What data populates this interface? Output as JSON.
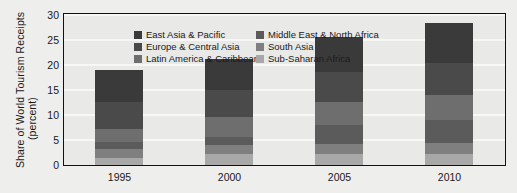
{
  "chart_data": {
    "type": "bar",
    "subtype": "stacked-column",
    "title": "",
    "xlabel": "",
    "ylabel": "Share of World Tourism Receipts (percent)",
    "ylabel_lines": [
      "Share of World Tourism Receipts",
      "(percent)"
    ],
    "categories": [
      "1995",
      "2000",
      "2005",
      "2010"
    ],
    "ylim": [
      0,
      30
    ],
    "yticks": [
      0,
      5,
      10,
      15,
      20,
      25,
      30
    ],
    "ytick_labels": [
      "0",
      "5",
      "10",
      "15",
      "20",
      "25",
      "30"
    ],
    "grid": true,
    "grid_axis": "y",
    "legend_position": "upper-left-inside",
    "legend_columns": 2,
    "series": [
      {
        "name": "East Asia & Pacific",
        "color": "#3a3a3a",
        "values": [
          6.3,
          6.2,
          7.1,
          8.1
        ]
      },
      {
        "name": "Europe & Central Asia",
        "color": "#4a4a4a",
        "values": [
          5.5,
          5.4,
          6.0,
          6.3
        ]
      },
      {
        "name": "Latin America & Caribbean",
        "color": "#6e6e6e",
        "values": [
          2.5,
          4.1,
          4.6,
          5.1
        ]
      },
      {
        "name": "Middle East & North Africa",
        "color": "#5b5b5b",
        "values": [
          1.5,
          1.6,
          3.8,
          4.6
        ]
      },
      {
        "name": "South Asia",
        "color": "#7f7f7f",
        "values": [
          1.7,
          1.8,
          2.0,
          2.2
        ]
      },
      {
        "name": "Sub-Saharan Africa",
        "color": "#a8a8a8",
        "values": [
          1.5,
          2.2,
          2.2,
          2.2
        ]
      }
    ],
    "totals": [
      19.0,
      21.3,
      25.7,
      28.5
    ]
  },
  "legend": {
    "entries": [
      {
        "label": "East Asia & Pacific"
      },
      {
        "label": "Middle East & North Africa"
      },
      {
        "label": "Europe & Central Asia"
      },
      {
        "label": "South Asia"
      },
      {
        "label": "Latin America & Caribbean"
      },
      {
        "label": "Sub-Saharan Africa"
      }
    ]
  }
}
